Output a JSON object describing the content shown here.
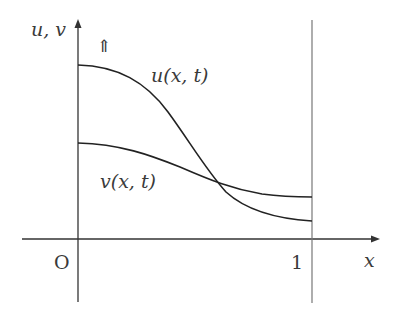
{
  "diagram": {
    "axis_label_y": "u, v",
    "axis_label_x": "x",
    "origin_label": "O",
    "x_tick_label": "1",
    "arrow_symbol": "⇑",
    "curve_u_label": "u(x, t)",
    "curve_v_label": "v(x, t)",
    "colors": {
      "curve": "#222222",
      "axis": "#333333",
      "boundary_line": "#777777",
      "text": "#3a3a3a"
    },
    "curves": [
      {
        "name": "u(x, t)",
        "description": "decreasing S-shaped profile, high at x=0, low at x=1",
        "start_rel": 0.84,
        "end_rel": 0.09
      },
      {
        "name": "v(x, t)",
        "description": "gently decreasing profile, crosses u near x≈0.6",
        "start_rel": 0.49,
        "end_rel": 0.22
      }
    ],
    "boundary": "vertical line at x = 1"
  }
}
